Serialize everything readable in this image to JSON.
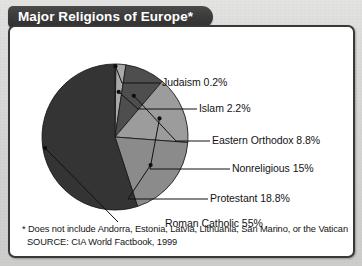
{
  "header": {
    "title": "Major Religions of Europe*"
  },
  "chart_data": {
    "type": "pie",
    "title": "Major Religions of Europe*",
    "legend_position": "callout-labels-right",
    "grid": false,
    "categories": [
      "Judaism",
      "Islam",
      "Eastern Orthodox",
      "Nonreligious",
      "Protestant",
      "Roman Catholic"
    ],
    "values": [
      0.2,
      2.2,
      8.8,
      15,
      18.8,
      55
    ],
    "unit": "%",
    "slices": [
      {
        "label": "Judaism 0.2%",
        "name": "Judaism",
        "value": 0.2,
        "color": "#8e8e8e"
      },
      {
        "label": "Islam 2.2%",
        "name": "Islam",
        "value": 2.2,
        "color": "#a9a9a9"
      },
      {
        "label": "Eastern Orthodox 8.8%",
        "name": "Eastern Orthodox",
        "value": 8.8,
        "color": "#4e4e4e"
      },
      {
        "label": "Nonreligious 15%",
        "name": "Nonreligious",
        "value": 15,
        "color": "#9c9c9c"
      },
      {
        "label": "Protestant 18.8%",
        "name": "Protestant",
        "value": 18.8,
        "color": "#8b8b8b"
      },
      {
        "label": "Roman Catholic 55%",
        "name": "Roman Catholic",
        "value": 55,
        "color": "#343434"
      }
    ]
  },
  "labels": {
    "judaism": "Judaism 0.2%",
    "islam": "Islam 2.2%",
    "eastern_orthodox": "Eastern Orthodox 8.8%",
    "nonreligious": "Nonreligious 15%",
    "protestant": "Protestant 18.8%",
    "roman_catholic": "Roman Catholic 55%"
  },
  "footnote": {
    "note": "* Does not include Andorra, Estonia, Latvia, Lithuania, San Marino, or the Vatican",
    "source": "SOURCE: CIA World Factbook, 1999"
  },
  "colors": {
    "banner": "#3c3c3c",
    "panel_border": "#39393a",
    "page_background": "#d6d6d4",
    "text": "#131313"
  }
}
